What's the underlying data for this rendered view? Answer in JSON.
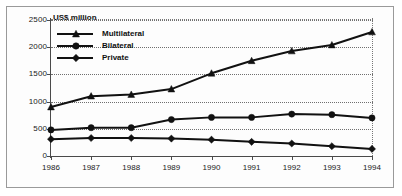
{
  "chart_data": {
    "type": "line",
    "title": "",
    "subtitle": "",
    "ylabel": "US$ million",
    "xlabel": "",
    "x": [
      1986,
      1987,
      1988,
      1989,
      1990,
      1991,
      1992,
      1993,
      1994
    ],
    "categories": [
      "1986",
      "1987",
      "1988",
      "1989",
      "1990",
      "1991",
      "1992",
      "1993",
      "1994"
    ],
    "ylim": [
      0,
      2500
    ],
    "yticks": [
      0,
      500,
      1000,
      1500,
      2000,
      2500
    ],
    "ytick_labels": [
      "0",
      "500",
      "1000",
      "1500",
      "2000",
      "2500"
    ],
    "grid": true,
    "grid_style": "dotted-horizontal",
    "legend_position": "top-left-inside",
    "series": [
      {
        "name": "Multilateral",
        "marker": "triangle",
        "color": "#111111",
        "values": [
          900,
          1100,
          1130,
          1230,
          1520,
          1750,
          1930,
          2040,
          2280
        ]
      },
      {
        "name": "Bilateral",
        "marker": "circle",
        "color": "#111111",
        "values": [
          480,
          520,
          520,
          670,
          710,
          710,
          770,
          760,
          700
        ]
      },
      {
        "name": "Private",
        "marker": "diamond",
        "color": "#111111",
        "values": [
          310,
          330,
          330,
          320,
          300,
          260,
          230,
          180,
          130
        ]
      }
    ]
  },
  "legend": {
    "items": [
      {
        "label": "Multilateral",
        "marker": "triangle"
      },
      {
        "label": "Bilateral",
        "marker": "circle"
      },
      {
        "label": "Private",
        "marker": "diamond"
      }
    ]
  },
  "colors": {
    "ink": "#111111",
    "axis": "#4a4a4a",
    "grid": "#6f6f6f",
    "frame": "#9a9a9a",
    "background": "#ffffff"
  }
}
